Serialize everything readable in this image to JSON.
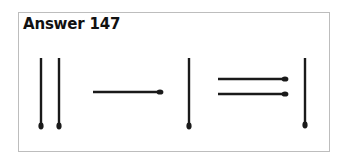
{
  "title": "Answer 147",
  "colors": {
    "match": "#1a1a1a",
    "frame": "#bdbdbd"
  },
  "matches": [
    {
      "id": "left-vertical-1",
      "orientation": "vertical",
      "x1": 41,
      "y1": 58,
      "x2": 41,
      "y2": 126,
      "head": "bottom"
    },
    {
      "id": "left-vertical-2",
      "orientation": "vertical",
      "x1": 59,
      "y1": 58,
      "x2": 59,
      "y2": 126,
      "head": "bottom"
    },
    {
      "id": "minus-horizontal",
      "orientation": "horizontal",
      "x1": 93,
      "y1": 92,
      "x2": 160,
      "y2": 92,
      "head": "right"
    },
    {
      "id": "middle-vertical",
      "orientation": "vertical",
      "x1": 189,
      "y1": 58,
      "x2": 189,
      "y2": 126,
      "head": "bottom"
    },
    {
      "id": "equals-top",
      "orientation": "horizontal",
      "x1": 218,
      "y1": 79,
      "x2": 285,
      "y2": 79,
      "head": "right"
    },
    {
      "id": "equals-bottom",
      "orientation": "horizontal",
      "x1": 218,
      "y1": 94,
      "x2": 285,
      "y2": 94,
      "head": "right"
    },
    {
      "id": "right-vertical",
      "orientation": "vertical",
      "x1": 305,
      "y1": 58,
      "x2": 305,
      "y2": 125,
      "head": "bottom"
    }
  ],
  "equation_reading": "II − I = I"
}
